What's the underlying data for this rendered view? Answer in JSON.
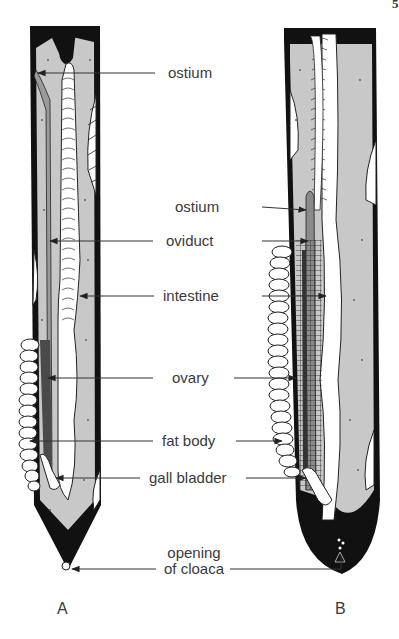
{
  "page_number": "5",
  "panels": [
    {
      "id": "A",
      "label": "A"
    },
    {
      "id": "B",
      "label": "B"
    }
  ],
  "labels": {
    "ostium_top": "ostium",
    "ostium": "ostium",
    "oviduct": "oviduct",
    "intestine": "intestine",
    "ovary": "ovary",
    "fat_body": "fat body",
    "gall_bladder": "gall bladder",
    "opening_line1": "opening",
    "opening_line2": "of cloaca"
  },
  "colors": {
    "outline": "#111111",
    "body_fill": "#c8c8c8",
    "organ_fill": "#ffffff",
    "leader": "#333333",
    "text": "#3a3a3a"
  }
}
